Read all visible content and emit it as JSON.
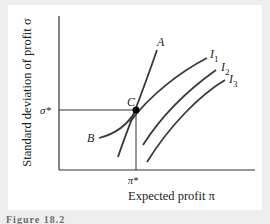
{
  "diagram": {
    "y_axis_label": "Standard deviation of profit σ",
    "x_axis_label": "Expected profit π",
    "y_tick_label": "σ*",
    "x_tick_label": "π*",
    "point_label": "C",
    "curves": [
      {
        "label": "A"
      },
      {
        "label": "B"
      },
      {
        "label": "I",
        "subscript": "1"
      },
      {
        "label": "I",
        "subscript": "2"
      },
      {
        "label": "I",
        "subscript": "3"
      }
    ],
    "caption": "Figure 18.2"
  },
  "colors": {
    "background": "#eeeef0",
    "panel": "#ffffff",
    "axis": "#333333",
    "curve": "#3a3a3a",
    "point": "#000000"
  }
}
